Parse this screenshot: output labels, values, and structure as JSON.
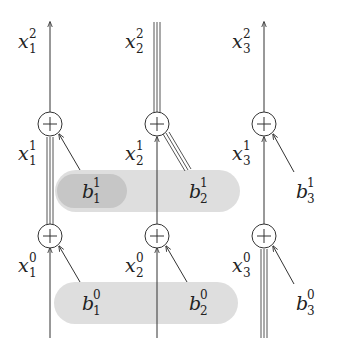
{
  "diagram": {
    "colors": {
      "stroke": "#333333",
      "pill_light": "#dedede",
      "pill_dark": "#c4c4c4",
      "background": "#ffffff"
    },
    "columns": [
      {
        "index": 1,
        "x": 50
      },
      {
        "index": 2,
        "x": 157
      },
      {
        "index": 3,
        "x": 264
      }
    ],
    "labels": {
      "x_top": [
        {
          "base": "x",
          "sub": "1",
          "sup": "2"
        },
        {
          "base": "x",
          "sub": "2",
          "sup": "2"
        },
        {
          "base": "x",
          "sub": "3",
          "sup": "2"
        }
      ],
      "x_mid": [
        {
          "base": "x",
          "sub": "1",
          "sup": "1"
        },
        {
          "base": "x",
          "sub": "2",
          "sup": "1"
        },
        {
          "base": "x",
          "sub": "3",
          "sup": "1"
        }
      ],
      "x_bot": [
        {
          "base": "x",
          "sub": "1",
          "sup": "0"
        },
        {
          "base": "x",
          "sub": "2",
          "sup": "0"
        },
        {
          "base": "x",
          "sub": "3",
          "sup": "0"
        }
      ],
      "b_layer1": [
        {
          "base": "b",
          "sub": "1",
          "sup": "1"
        },
        {
          "base": "b",
          "sub": "2",
          "sup": "1"
        },
        {
          "base": "b",
          "sub": "3",
          "sup": "1"
        }
      ],
      "b_layer0": [
        {
          "base": "b",
          "sub": "1",
          "sup": "0"
        },
        {
          "base": "b",
          "sub": "2",
          "sup": "0"
        },
        {
          "base": "b",
          "sub": "3",
          "sup": "0"
        }
      ]
    },
    "adder_symbol": "+",
    "highlighted_paths": [
      "x1 segment between layer0 and layer1 adders",
      "b2^1 to column 2 adder",
      "x2 top segment",
      "x3 bottom segment"
    ]
  }
}
